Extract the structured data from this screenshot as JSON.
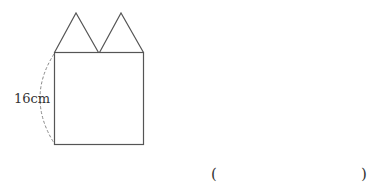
{
  "figure": {
    "side_label": "16cm",
    "answer_open": "(",
    "answer_close": ")",
    "colors": {
      "stroke": "#555555",
      "dash": "#888888"
    }
  }
}
